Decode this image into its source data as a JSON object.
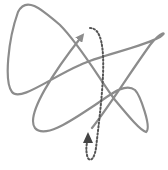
{
  "figure": {
    "title": "Tangled path with loop-back arrow",
    "colors": {
      "background": "#ffffff",
      "solid_line": "#8c8c8c",
      "dotted_line": "#555555"
    },
    "elements": [
      {
        "name": "tangled-path",
        "style": "solid",
        "arrowhead": "up-right"
      },
      {
        "name": "loop-back-path",
        "style": "dotted",
        "arrowhead": "up"
      }
    ]
  }
}
